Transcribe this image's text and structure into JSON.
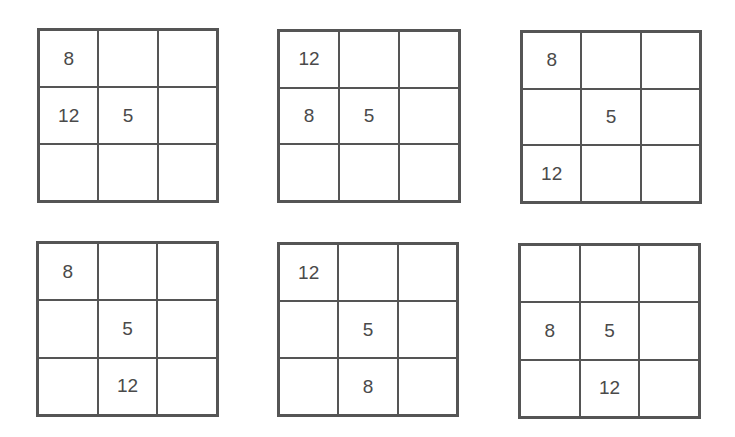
{
  "puzzles": [
    {
      "cells": [
        "8",
        "",
        "",
        "12",
        "5",
        "",
        "",
        "",
        ""
      ]
    },
    {
      "cells": [
        "12",
        "",
        "",
        "8",
        "5",
        "",
        "",
        "",
        ""
      ]
    },
    {
      "cells": [
        "8",
        "",
        "",
        "",
        "5",
        "",
        "12",
        "",
        ""
      ]
    },
    {
      "cells": [
        "8",
        "",
        "",
        "",
        "5",
        "",
        "",
        "12",
        ""
      ]
    },
    {
      "cells": [
        "12",
        "",
        "",
        "",
        "5",
        "",
        "",
        "8",
        ""
      ]
    },
    {
      "cells": [
        "",
        "",
        "",
        "8",
        "5",
        "",
        "",
        "12",
        ""
      ]
    }
  ]
}
